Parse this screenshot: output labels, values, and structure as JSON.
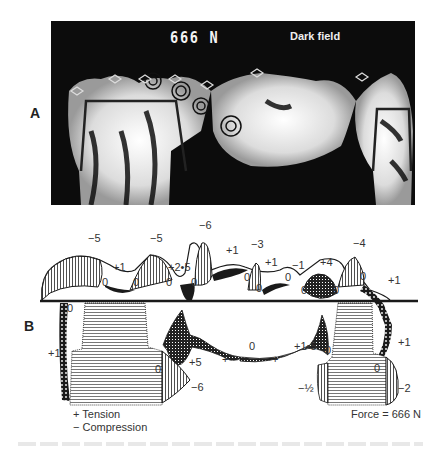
{
  "figure": {
    "panel_a": {
      "label": "A",
      "force_text": "666 N",
      "mode_text": "Dark field",
      "image_description": "Photoelastic stress fringe pattern of a fixed partial denture model under load"
    },
    "panel_b": {
      "label": "B",
      "stress_values_top": [
        {
          "id": "t1",
          "text": "−5"
        },
        {
          "id": "t2",
          "text": "+1"
        },
        {
          "id": "t3",
          "text": "0"
        },
        {
          "id": "t4",
          "text": "0"
        },
        {
          "id": "t5",
          "text": "−5"
        },
        {
          "id": "t6",
          "text": "+2•5"
        },
        {
          "id": "t7",
          "text": "0"
        },
        {
          "id": "t8",
          "text": "0"
        },
        {
          "id": "t9",
          "text": "−6"
        },
        {
          "id": "t10",
          "text": "+1"
        },
        {
          "id": "t11",
          "text": "0"
        },
        {
          "id": "t12",
          "text": "−3"
        },
        {
          "id": "t13",
          "text": "+1"
        },
        {
          "id": "t14",
          "text": "0"
        },
        {
          "id": "t15",
          "text": "0"
        },
        {
          "id": "t16",
          "text": "−1"
        },
        {
          "id": "t17",
          "text": "+4"
        },
        {
          "id": "t18",
          "text": "0"
        },
        {
          "id": "t19",
          "text": "0"
        },
        {
          "id": "t20",
          "text": "−4"
        },
        {
          "id": "t21",
          "text": "0"
        },
        {
          "id": "t22",
          "text": "+1"
        }
      ],
      "stress_values_bottom": [
        {
          "id": "b1",
          "text": "0"
        },
        {
          "id": "b2",
          "text": "+1"
        },
        {
          "id": "b3",
          "text": "0"
        },
        {
          "id": "b4",
          "text": "+5"
        },
        {
          "id": "b5",
          "text": "−6"
        },
        {
          "id": "b6",
          "text": "+"
        },
        {
          "id": "b7",
          "text": "0"
        },
        {
          "id": "b8",
          "text": "+"
        },
        {
          "id": "b9",
          "text": "+1•5"
        },
        {
          "id": "b10",
          "text": "0"
        },
        {
          "id": "b11",
          "text": "0"
        },
        {
          "id": "b12",
          "text": "−½"
        },
        {
          "id": "b13",
          "text": "+1"
        },
        {
          "id": "b14",
          "text": "−2"
        }
      ],
      "legend": {
        "tension": "+ Tension",
        "compression": "− Compression"
      },
      "force_note": "Force = 666 N"
    }
  },
  "colors": {
    "ink": "#1a1a1a",
    "photo_background": "#0c0c0c",
    "fringe_light": "#f2f2f2",
    "hatch_gray": "#8a8a8a"
  }
}
